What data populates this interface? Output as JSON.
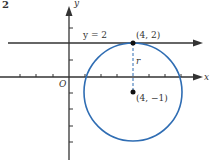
{
  "figure_number": "2",
  "axes": {
    "x_label": "x",
    "y_label": "y",
    "origin_label": "O"
  },
  "line": {
    "label": "y = 2",
    "equation": "y = 2"
  },
  "tangent_point": {
    "label": "(4, 2)",
    "x": 4,
    "y": 2
  },
  "center": {
    "label": "(4, −1)",
    "x": 4,
    "y": -1
  },
  "radius_label": "r",
  "circle": {
    "cx": 4,
    "cy": -1,
    "r": 3,
    "color": "#2f6db3"
  },
  "colors": {
    "axis": "#333333",
    "circle": "#2f6db3"
  }
}
